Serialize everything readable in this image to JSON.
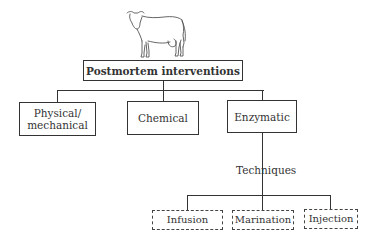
{
  "illustration": {
    "icon": "cow-icon"
  },
  "root": {
    "label": "Postmortem interventions"
  },
  "categories": [
    {
      "label": "Physical/\nmechanical",
      "line1": "Physical/",
      "line2": "mechanical"
    },
    {
      "label": "Chemical"
    },
    {
      "label": "Enzymatic"
    }
  ],
  "connector_label": "Techniques",
  "techniques": [
    {
      "label": "Infusion"
    },
    {
      "label": "Marination"
    },
    {
      "label": "Injection"
    }
  ]
}
